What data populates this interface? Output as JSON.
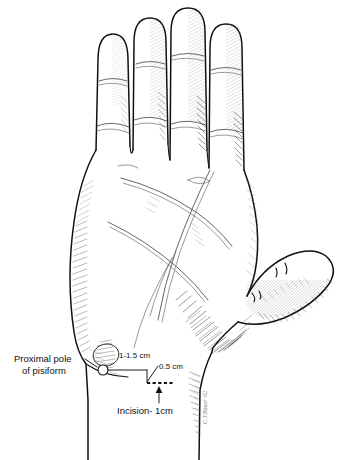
{
  "figure": {
    "background_color": "#ffffff",
    "ink_color": "#101010"
  },
  "annotations": {
    "proximal_pole_line1": "Proximal pole",
    "proximal_pole_line2": "of pisiform",
    "distance_pisiform_to_incision": "1-1.5 cm",
    "offset_measure": "0.5 cm",
    "incision_label": "Incision- 1cm"
  },
  "signature": {
    "artist_mark": "C.T.Bauer '02"
  },
  "anatomy_labels": {
    "thumb": "thumb",
    "index_finger": "index finger",
    "middle_finger": "middle finger",
    "ring_finger": "ring finger",
    "small_finger": "small finger",
    "palm": "palm",
    "thenar_eminence": "thenar eminence",
    "hypothenar_eminence": "hypothenar eminence",
    "wrist": "wrist",
    "distal_palmar_crease": "distal palmar crease",
    "proximal_palmar_crease": "proximal palmar crease",
    "thenar_crease": "thenar crease"
  }
}
